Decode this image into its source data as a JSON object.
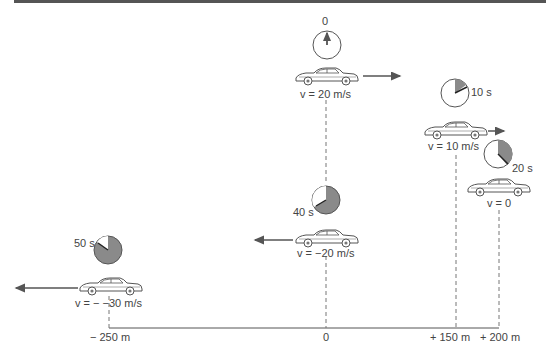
{
  "diagram": {
    "states": [
      {
        "time": "0",
        "velocity": "v = 20 m/s",
        "direction": "right"
      },
      {
        "time": "10 s",
        "velocity": "v = 10 m/s",
        "direction": "right"
      },
      {
        "time": "20 s",
        "velocity": "v = 0",
        "direction": "none"
      },
      {
        "time": "40 s",
        "velocity": "v = −20 m/s",
        "direction": "left"
      },
      {
        "time": "50 s",
        "velocity": "v = − −30 m/s",
        "direction": "left"
      }
    ],
    "axis": {
      "ticks": [
        "− 250 m",
        "0",
        "+ 150 m",
        "+ 200 m"
      ]
    }
  },
  "colors": {
    "line": "#555555",
    "shade": "#8a8a8a",
    "arrow": "#555555"
  }
}
